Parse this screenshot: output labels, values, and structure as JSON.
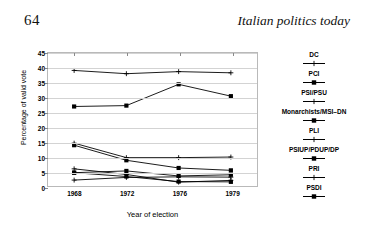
{
  "page": {
    "folio": "64",
    "running_head": "Italian politics today"
  },
  "chart_data": {
    "type": "line",
    "title": "",
    "xlabel": "Year of election",
    "ylabel": "Percentage of valid vote",
    "categories": [
      "1968",
      "1972",
      "1976",
      "1979"
    ],
    "x": [
      1968,
      1972,
      1976,
      1979
    ],
    "ylim": [
      0,
      45
    ],
    "yticks": [
      0,
      5,
      10,
      15,
      20,
      25,
      30,
      35,
      40,
      45
    ],
    "grid": "horizontal",
    "legend_position": "right",
    "series": [
      {
        "name": "DC",
        "marker": "cross",
        "values": [
          39.1,
          38.0,
          38.7,
          38.3
        ]
      },
      {
        "name": "PCI",
        "marker": "square",
        "values": [
          26.9,
          27.2,
          34.4,
          30.4
        ]
      },
      {
        "name": "PSI/PSU",
        "marker": "cross",
        "values": [
          14.5,
          9.6,
          9.6,
          9.8
        ]
      },
      {
        "name": "Monarchists/MSI–DN",
        "marker": "square",
        "values": [
          13.8,
          8.7,
          6.1,
          5.3
        ]
      },
      {
        "name": "PLI",
        "marker": "cross",
        "values": [
          5.8,
          3.9,
          1.3,
          1.9
        ]
      },
      {
        "name": "PSIUP/PDUP/DP",
        "marker": "square",
        "values": [
          4.5,
          3.2,
          1.5,
          1.4
        ]
      },
      {
        "name": "PRI",
        "marker": "cross",
        "values": [
          2.0,
          2.9,
          3.1,
          3.0
        ]
      },
      {
        "name": "PSDI",
        "marker": "square",
        "values": [
          4.5,
          5.1,
          3.4,
          3.8
        ]
      }
    ]
  }
}
